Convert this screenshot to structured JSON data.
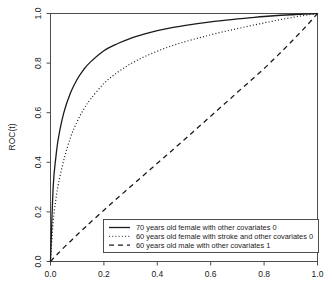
{
  "chart_data": {
    "type": "line",
    "title": "",
    "xlabel": "",
    "ylabel": "ROC(t)",
    "xlim": [
      0,
      1
    ],
    "ylim": [
      0,
      1
    ],
    "grid": false,
    "legend_position": "bottom-right",
    "xticks": [
      "0.0",
      "0.2",
      "0.4",
      "0.6",
      "0.8",
      "1.0"
    ],
    "xtick_values": [
      0.0,
      0.2,
      0.4,
      0.6,
      0.8,
      1.0
    ],
    "yticks": [
      "0.0",
      "0.2",
      "0.4",
      "0.6",
      "0.8",
      "1.0"
    ],
    "ytick_values": [
      0.0,
      0.2,
      0.4,
      0.6,
      0.8,
      1.0
    ],
    "x": [
      0.0,
      0.01,
      0.02,
      0.03,
      0.05,
      0.075,
      0.1,
      0.125,
      0.15,
      0.2,
      0.25,
      0.3,
      0.35,
      0.4,
      0.45,
      0.5,
      0.55,
      0.6,
      0.65,
      0.7,
      0.75,
      0.8,
      0.85,
      0.9,
      0.95,
      1.0
    ],
    "series": [
      {
        "name": "70 years old female with other covariates 0",
        "style": "solid",
        "color": "#1a1a1a",
        "values": [
          0.0,
          0.3,
          0.42,
          0.5,
          0.6,
          0.68,
          0.735,
          0.775,
          0.805,
          0.85,
          0.878,
          0.9,
          0.917,
          0.931,
          0.942,
          0.951,
          0.959,
          0.966,
          0.972,
          0.978,
          0.983,
          0.988,
          0.992,
          0.995,
          0.998,
          1.0
        ]
      },
      {
        "name": "60 years old female with stroke and other covariates 0",
        "style": "dotted",
        "color": "#4d4d4d",
        "values": [
          0.0,
          0.16,
          0.25,
          0.315,
          0.41,
          0.5,
          0.565,
          0.615,
          0.655,
          0.718,
          0.762,
          0.797,
          0.825,
          0.848,
          0.868,
          0.885,
          0.9,
          0.914,
          0.927,
          0.939,
          0.951,
          0.962,
          0.973,
          0.983,
          0.992,
          1.0
        ]
      },
      {
        "name": "60 years old male with other covariates 1",
        "style": "dashed",
        "color": "#1a1a1a",
        "values": [
          0.0,
          0.012,
          0.023,
          0.034,
          0.056,
          0.082,
          0.108,
          0.133,
          0.158,
          0.207,
          0.255,
          0.302,
          0.349,
          0.396,
          0.443,
          0.49,
          0.538,
          0.586,
          0.634,
          0.682,
          0.73,
          0.778,
          0.83,
          0.884,
          0.94,
          1.0
        ]
      }
    ]
  },
  "legend": {
    "items": [
      {
        "label": "70 years old female with other covariates 0",
        "style": "solid"
      },
      {
        "label": "60 years old female with stroke and other covariates 0",
        "style": "dotted"
      },
      {
        "label": "60 years old male with other covariates 1",
        "style": "dashed"
      }
    ]
  }
}
